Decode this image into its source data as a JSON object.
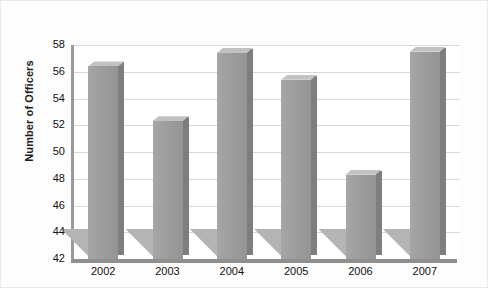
{
  "chart_data": {
    "type": "bar",
    "title": "",
    "xlabel": "",
    "ylabel": "Number of Officers",
    "categories": [
      "2002",
      "2003",
      "2004",
      "2005",
      "2006",
      "2007"
    ],
    "values": [
      56.4,
      52.3,
      57.4,
      55.4,
      48.3,
      57.5
    ],
    "ylim": [
      42,
      58
    ],
    "ytick_labels": [
      "42",
      "44",
      "46",
      "48",
      "50",
      "52",
      "54",
      "56",
      "58"
    ],
    "ytick_values": [
      42,
      44,
      46,
      48,
      50,
      52,
      54,
      56,
      58
    ],
    "grid": true,
    "legend": "none",
    "series": [
      {
        "name": "Number of Officers",
        "values": [
          56.4,
          52.3,
          57.4,
          55.4,
          48.3,
          57.5
        ]
      }
    ],
    "colors": {
      "bar_front": "#9d9d9d",
      "bar_side": "#7e7e7e",
      "bar_top": "#c2c2c2",
      "gridline": "#d8d8d8",
      "axis": "#9a9a9a",
      "background": "#ffffff",
      "text": "#111111"
    }
  }
}
